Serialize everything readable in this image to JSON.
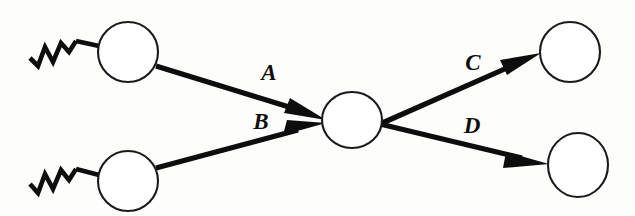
{
  "diagram": {
    "type": "directed-graph",
    "background_color": "#fdfdfb",
    "stroke_color": "#0d0d0d",
    "node_fill_color": "#ffffff",
    "nodes": [
      {
        "id": "in-top",
        "label": "",
        "role": "input-node",
        "cx": 128,
        "cy": 52,
        "rx": 30,
        "ry": 30
      },
      {
        "id": "in-bottom",
        "label": "",
        "role": "input-node",
        "cx": 128,
        "cy": 181,
        "rx": 30,
        "ry": 30
      },
      {
        "id": "center",
        "label": "",
        "role": "hidden-node",
        "cx": 352,
        "cy": 120,
        "rx": 30,
        "ry": 28
      },
      {
        "id": "out-top",
        "label": "",
        "role": "output-node",
        "cx": 570,
        "cy": 52,
        "rx": 30,
        "ry": 30
      },
      {
        "id": "out-bottom",
        "label": "",
        "role": "output-node",
        "cx": 578,
        "cy": 165,
        "rx": 30,
        "ry": 32
      }
    ],
    "edges": [
      {
        "id": "edge-a",
        "label": "A",
        "from": "in-top",
        "to": "center",
        "label_x": 269,
        "label_y": 80
      },
      {
        "id": "edge-b",
        "label": "B",
        "from": "in-bottom",
        "to": "center",
        "label_x": 261,
        "label_y": 129
      },
      {
        "id": "edge-c",
        "label": "C",
        "from": "center",
        "to": "out-top",
        "label_x": 473,
        "label_y": 70
      },
      {
        "id": "edge-d",
        "label": "D",
        "from": "center",
        "to": "out-bottom",
        "label_x": 472,
        "label_y": 133
      }
    ],
    "input_symbols": [
      {
        "id": "zigzag-top",
        "name": "zigzag-input-symbol",
        "attached_to": "in-top"
      },
      {
        "id": "zigzag-bottom",
        "name": "zigzag-input-symbol",
        "attached_to": "in-bottom"
      }
    ]
  }
}
